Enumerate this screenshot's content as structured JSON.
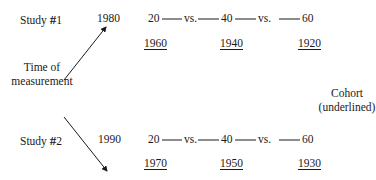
{
  "studies": [
    {
      "label": "Study",
      "hash": "#",
      "number": "1",
      "year": "1980",
      "ages": [
        "20",
        "40",
        "60"
      ],
      "separator": "vs.",
      "cohorts": [
        "1960",
        "1940",
        "1920"
      ]
    },
    {
      "label": "Study",
      "hash": "#",
      "number": "2",
      "year": "1990",
      "ages": [
        "20",
        "40",
        "60"
      ],
      "separator": "vs.",
      "cohorts": [
        "1970",
        "1950",
        "1930"
      ]
    }
  ],
  "time_label": {
    "line1": "Time of",
    "line2": "measurement"
  },
  "cohort_label": {
    "line1": "Cohort",
    "line2": "(underlined)"
  }
}
